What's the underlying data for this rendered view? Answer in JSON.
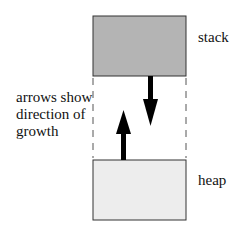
{
  "diagram": {
    "regions": [
      {
        "id": "stack",
        "label": "stack",
        "fill": "#b4b4b4"
      },
      {
        "id": "heap",
        "label": "heap",
        "fill": "#ededed"
      }
    ],
    "annotation": {
      "line1": "arrows show",
      "line2": "direction of",
      "line3": "growth"
    },
    "arrows": [
      {
        "from": "stack",
        "direction": "down"
      },
      {
        "from": "heap",
        "direction": "up"
      }
    ]
  }
}
